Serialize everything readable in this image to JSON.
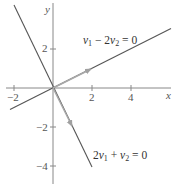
{
  "figure": {
    "axes": {
      "x_label": "x",
      "y_label": "y",
      "x_ticks": [
        {
          "value": -2,
          "label": "−2"
        },
        {
          "value": 2,
          "label": "2"
        },
        {
          "value": 4,
          "label": "4"
        }
      ],
      "y_ticks": [
        {
          "value": 2,
          "label": "2"
        },
        {
          "value": -2,
          "label": "−2"
        },
        {
          "value": -4,
          "label": "−4"
        }
      ],
      "x_range": [
        -2.2,
        5.9
      ],
      "y_range": [
        -4.9,
        4.4
      ]
    },
    "lines": [
      {
        "name": "line-v1-minus-2v2",
        "equation": "v1 − 2v2 = 0",
        "label_parts": {
          "a": "v",
          "a_sub": "1",
          "op": " − 2",
          "b": "v",
          "b_sub": "2",
          "rhs": " = 0"
        },
        "from": [
          -2.2,
          -1.1
        ],
        "to": [
          5.9,
          2.95
        ],
        "color": "#555555"
      },
      {
        "name": "line-2v1-plus-v2",
        "equation": "2v1 + v2 = 0",
        "label_parts": {
          "pre": "2",
          "a": "v",
          "a_sub": "1",
          "op": " + ",
          "b": "v",
          "b_sub": "2",
          "rhs": " = 0"
        },
        "from": [
          -2.0,
          4.2
        ],
        "to": [
          2.0,
          -4.0
        ],
        "color": "#555555"
      }
    ],
    "vectors": [
      {
        "name": "eigenvector-2-1",
        "from": [
          0,
          0
        ],
        "to": [
          2,
          1
        ],
        "color": "#a8a8a8"
      },
      {
        "name": "eigenvector-1-neg2",
        "from": [
          0,
          0
        ],
        "to": [
          1,
          -2
        ],
        "color": "#a8a8a8"
      }
    ],
    "colors": {
      "axis": "#888888",
      "line": "#555555",
      "vector": "#a8a8a8",
      "text": "#444444"
    }
  }
}
